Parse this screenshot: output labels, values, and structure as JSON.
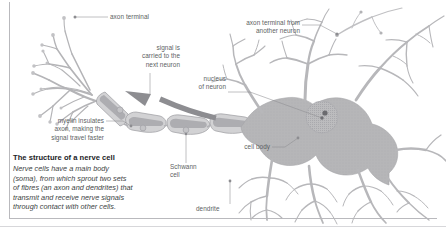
{
  "figure": {
    "title": "The structure of a nerve cell",
    "body": "Nerve cells have a main body\n(soma), from which sprout two sets\nof fibres (an axon and dendrites) that\ntransmit and receive nerve signals\nthrough contact with other cells."
  },
  "labels": {
    "axon_terminal": "axon terminal",
    "signal_carried": "signal is\ncarried to the\nnext neuron",
    "myelin": "myelin insulates\naxon, making the\nsignal travel faster",
    "schwann_cell": "Schwann\ncell",
    "nucleus": "nucleus\nof neuron",
    "axon_terminal_other": "axon terminal from\nanother neuron",
    "cell_body": "cell body",
    "dendrite": "dendrite"
  },
  "colors": {
    "background": "#ffffff",
    "cell_fill": "#b6b6b8",
    "cell_fill_light": "#c9c9cb",
    "myelin_fill": "#d4d4d6",
    "myelin_band": "#a9a9ac",
    "outline": "#8e8e92",
    "arrow": "#8d8d91",
    "leader_line": "#8d8d91",
    "label_text": "#5d5f63",
    "caption_title": "#222226",
    "caption_body": "#3d3f43",
    "frame_rule": "#b9b9bd",
    "nucleus_fill": "#bcbcbe",
    "nucleolus": "#6a6a6e"
  }
}
